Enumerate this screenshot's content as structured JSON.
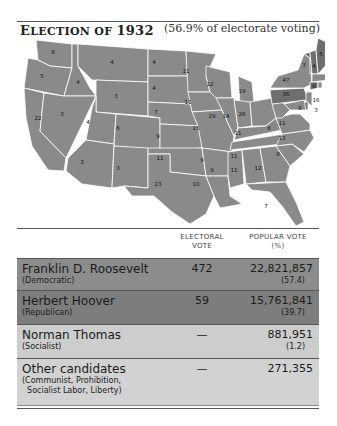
{
  "header": {
    "title_prefix": "E",
    "title_rest": "LECTION OF",
    "title_year": "1932",
    "subtitle": "(56.9% of electorate voting)"
  },
  "map": {
    "colors": {
      "democratic": "#8a8a8a",
      "republican": "#6e6e6e",
      "border": "#ffffff"
    },
    "electoral_votes": [
      {
        "state": "WA",
        "ev": "8"
      },
      {
        "state": "OR",
        "ev": "5"
      },
      {
        "state": "CA",
        "ev": "22"
      },
      {
        "state": "ID",
        "ev": "4"
      },
      {
        "state": "NV",
        "ev": "3"
      },
      {
        "state": "MT",
        "ev": "4"
      },
      {
        "state": "WY",
        "ev": "3"
      },
      {
        "state": "UT",
        "ev": "4"
      },
      {
        "state": "AZ",
        "ev": "3"
      },
      {
        "state": "CO",
        "ev": "6"
      },
      {
        "state": "NM",
        "ev": "3"
      },
      {
        "state": "ND",
        "ev": "4"
      },
      {
        "state": "SD",
        "ev": "4"
      },
      {
        "state": "NE",
        "ev": "7"
      },
      {
        "state": "KS",
        "ev": "9"
      },
      {
        "state": "OK",
        "ev": "11"
      },
      {
        "state": "TX",
        "ev": "23"
      },
      {
        "state": "MN",
        "ev": "11"
      },
      {
        "state": "IA",
        "ev": "11"
      },
      {
        "state": "MO",
        "ev": "15"
      },
      {
        "state": "AR",
        "ev": "9"
      },
      {
        "state": "LA",
        "ev": "10"
      },
      {
        "state": "WI",
        "ev": "12"
      },
      {
        "state": "IL",
        "ev": "29"
      },
      {
        "state": "MI",
        "ev": "19"
      },
      {
        "state": "IN",
        "ev": "14"
      },
      {
        "state": "OH",
        "ev": "26"
      },
      {
        "state": "KY",
        "ev": "11"
      },
      {
        "state": "TN",
        "ev": "11"
      },
      {
        "state": "MS",
        "ev": "9"
      },
      {
        "state": "AL",
        "ev": "11"
      },
      {
        "state": "GA",
        "ev": "12"
      },
      {
        "state": "FL",
        "ev": "7"
      },
      {
        "state": "SC",
        "ev": "8"
      },
      {
        "state": "NC",
        "ev": "13"
      },
      {
        "state": "VA",
        "ev": "11"
      },
      {
        "state": "WV",
        "ev": "8"
      },
      {
        "state": "PA",
        "ev": "36"
      },
      {
        "state": "NY",
        "ev": "47"
      },
      {
        "state": "VT",
        "ev": "3"
      },
      {
        "state": "NH",
        "ev": "4"
      },
      {
        "state": "ME",
        "ev": "5"
      },
      {
        "state": "MA",
        "ev": "17"
      },
      {
        "state": "RI",
        "ev": "4"
      },
      {
        "state": "CT",
        "ev": "8"
      },
      {
        "state": "NJ",
        "ev": "16"
      },
      {
        "state": "DE",
        "ev": "3"
      },
      {
        "state": "MD",
        "ev": "8"
      }
    ]
  },
  "table": {
    "headers": {
      "electoral_line1": "ELECTORAL",
      "electoral_line2": "VOTE",
      "popular_line1": "POPULAR VOTE",
      "popular_line2": "(%)"
    },
    "rows": [
      {
        "candidate": "Franklin D. Roosevelt",
        "party": "(Democratic)",
        "electoral": "472",
        "popular": "22,821,857",
        "percent": "(57.4)"
      },
      {
        "candidate": "Herbert Hoover",
        "party": "(Republican)",
        "electoral": "59",
        "popular": "15,761,841",
        "percent": "(39.7)"
      },
      {
        "candidate": "Norman Thomas",
        "party": "(Socialist)",
        "electoral": "—",
        "popular": "881,951",
        "percent": "(1.2)"
      },
      {
        "candidate": "Other candidates",
        "party": "(Communist, Prohibition,\n  Socialist Labor, Liberty)",
        "electoral": "—",
        "popular": "271,355",
        "percent": ""
      }
    ]
  }
}
